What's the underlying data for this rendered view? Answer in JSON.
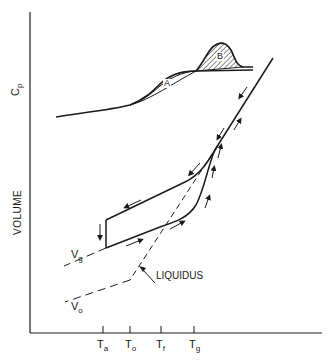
{
  "figure": {
    "y_axis_labels": {
      "upper": "C",
      "upper_sub": "p",
      "lower": "VOLUME"
    },
    "x_axis_ticks": [
      {
        "main": "T",
        "sub": "a"
      },
      {
        "main": "T",
        "sub": "o"
      },
      {
        "main": "T",
        "sub": "f"
      },
      {
        "main": "T",
        "sub": "g"
      }
    ],
    "curve_labels": {
      "vg_main": "V",
      "vg_sub": "g",
      "vo_main": "V",
      "vo_sub": "o",
      "liquidus": "LIQUIDUS",
      "region_a": "A",
      "region_b": "B"
    },
    "colors": {
      "ink": "#1a1a1a",
      "background": "#ffffff"
    }
  }
}
